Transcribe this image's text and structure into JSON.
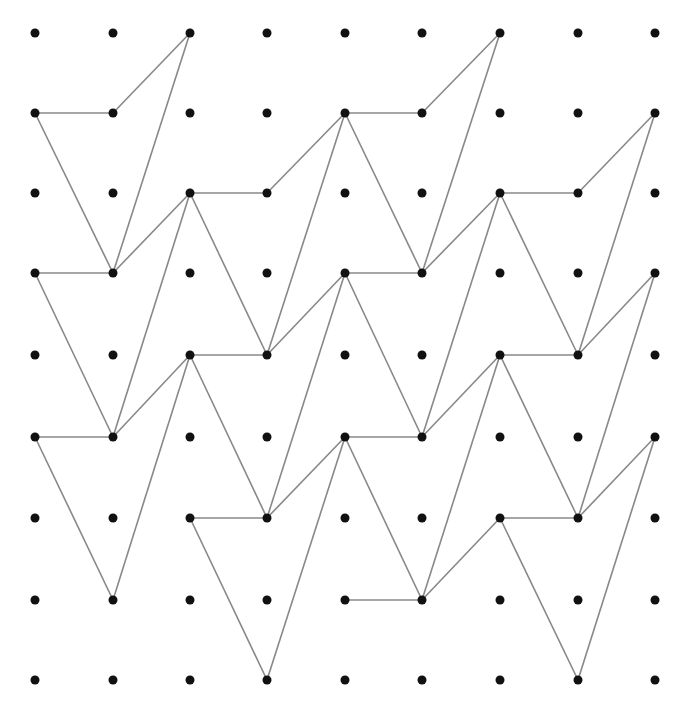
{
  "diagram": {
    "type": "dot-grid-tessellation",
    "grid": {
      "columns": 9,
      "rows": 9
    },
    "colors": {
      "dot": "#111111",
      "line": "#888888",
      "background": "#ffffff"
    },
    "tile_edges_relative": [
      [
        [
          0,
          0
        ],
        [
          1,
          0
        ]
      ],
      [
        [
          1,
          0
        ],
        [
          2,
          -1
        ]
      ],
      [
        [
          2,
          -1
        ],
        [
          1,
          2
        ]
      ],
      [
        [
          0,
          0
        ],
        [
          1,
          2
        ]
      ]
    ],
    "tile_origins": [
      [
        0,
        1
      ],
      [
        0,
        3
      ],
      [
        0,
        5
      ],
      [
        2,
        2
      ],
      [
        2,
        4
      ],
      [
        2,
        6
      ],
      [
        4,
        1
      ],
      [
        4,
        3
      ],
      [
        4,
        5
      ],
      [
        6,
        2
      ],
      [
        6,
        4
      ],
      [
        6,
        6
      ]
    ],
    "extra_edges": [
      [
        [
          4,
          7
        ],
        [
          5,
          7
        ]
      ],
      [
        [
          5,
          7
        ],
        [
          6,
          6
        ]
      ]
    ]
  }
}
